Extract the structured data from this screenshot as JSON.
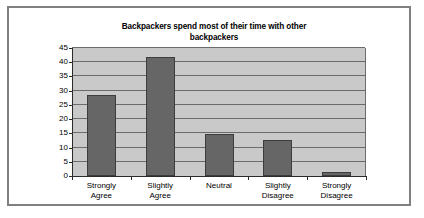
{
  "figure": {
    "border_color": "#808080",
    "background": "#ffffff"
  },
  "chart_data": {
    "type": "bar",
    "title": "Backpackers spend most of their time with other backpackers",
    "title_line1": "Backpackers spend most of their time with other",
    "title_line2": "backpackers",
    "xlabel": "",
    "ylabel": "",
    "categories": [
      "Strongly\nAgree",
      "Slightly\nAgree",
      "Neutral",
      "Slightly\nDisagree",
      "Strongly\nDisagree"
    ],
    "values": [
      28.5,
      42,
      14.8,
      12.5,
      1.5
    ],
    "ylim": [
      0,
      45
    ],
    "yticks": [
      0,
      5,
      10,
      15,
      20,
      25,
      30,
      35,
      40,
      45
    ],
    "ytick_labels": [
      "0",
      "5",
      "10",
      "15",
      "20",
      "25",
      "30",
      "35",
      "40",
      "45"
    ],
    "grid": true,
    "grid_axis": "y",
    "legend": false,
    "bar_color": "#666666",
    "plot_background": "#c9c9c9",
    "gridline_color": "#6b6b6b",
    "axis_color": "#2b2b2b"
  }
}
